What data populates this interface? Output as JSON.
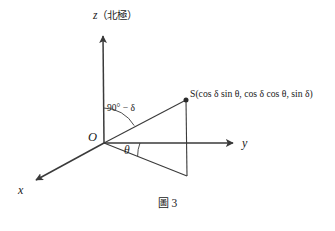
{
  "figure": {
    "caption_label": "圖",
    "caption_number": "3",
    "background_color": "#ffffff",
    "stroke_color": "#3a3a3a",
    "text_color": "#1a1a1a"
  },
  "axes": {
    "z": {
      "letter": "z",
      "annotation": "（北極）",
      "full": "z（北極）"
    },
    "y": {
      "letter": "y"
    },
    "x": {
      "letter": "x"
    }
  },
  "points": {
    "origin": {
      "label": "O"
    },
    "s": {
      "label": "S",
      "coordinates_text": "S(cos δ sin θ, cos δ cos θ, sin δ)",
      "coordinate_x": "cos δ sin θ",
      "coordinate_y": "cos δ cos θ",
      "coordinate_z": "sin δ"
    }
  },
  "angles": {
    "azimuth": {
      "label": "θ",
      "description": "angle from y-axis in xy-plane"
    },
    "colatitude": {
      "label": "90° − δ",
      "description": "angle from z-axis to OS"
    }
  },
  "geometry": {
    "origin_px": [
      104,
      143
    ],
    "z_tip_px": [
      103,
      33
    ],
    "y_tip_px": [
      236,
      143
    ],
    "x_tip_px": [
      33,
      182
    ],
    "s_px": [
      186,
      100
    ],
    "s_foot_px": [
      187,
      176
    ],
    "y_crossing_px": [
      187,
      143
    ]
  }
}
